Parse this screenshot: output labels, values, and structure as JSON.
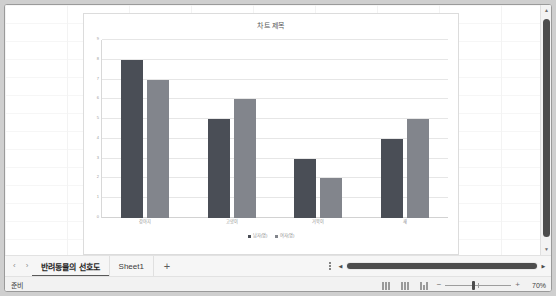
{
  "window": {
    "title": "반려동물의 선호도"
  },
  "chart_data": {
    "type": "bar",
    "title": "차트 제목",
    "xlabel": "",
    "ylabel": "",
    "categories": [
      "강아지",
      "고양이",
      "거북이",
      "새"
    ],
    "series": [
      {
        "name": "남자(명)",
        "color": "#4a4e56",
        "values": [
          8,
          5,
          3,
          4
        ]
      },
      {
        "name": "여자(명)",
        "color": "#82858c",
        "values": [
          7,
          6,
          2,
          5
        ]
      }
    ],
    "ylim": [
      0,
      9
    ],
    "yticks": [
      "0",
      "1",
      "2",
      "3",
      "4",
      "5",
      "6",
      "7",
      "8",
      "9"
    ],
    "grid": true,
    "legend_position": "bottom"
  },
  "vscroll": {
    "up_arrow": "▲",
    "down_arrow": "▼"
  },
  "tabbar": {
    "prev_label": "‹",
    "next_label": "›",
    "tabs": [
      {
        "label": "반려동물의 선호도",
        "active": true
      },
      {
        "label": "Sheet1",
        "active": false
      }
    ],
    "add_label": "+",
    "hscroll_left": "◀",
    "hscroll_right": "▶"
  },
  "statusbar": {
    "status": "준비",
    "view_modes": [
      "기본 보기",
      "페이지 레이아웃 보기",
      "페이지 나누기 미리 보기"
    ],
    "zoom_out": "−",
    "zoom_in": "+",
    "zoom_value": "70%"
  }
}
